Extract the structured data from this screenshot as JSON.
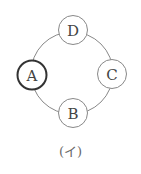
{
  "diagram": {
    "ring": {
      "cx": 72,
      "cy": 73,
      "r": 41,
      "stroke": "#888888",
      "stroke_width": 1
    },
    "nodes": [
      {
        "id": "D",
        "label": "D",
        "cx": 73,
        "cy": 30,
        "r": 14.5,
        "stroke": "#888888",
        "stroke_width": 1,
        "highlighted": false
      },
      {
        "id": "C",
        "label": "C",
        "cx": 112,
        "cy": 74,
        "r": 14.5,
        "stroke": "#888888",
        "stroke_width": 1,
        "highlighted": false
      },
      {
        "id": "B",
        "label": "B",
        "cx": 73,
        "cy": 113,
        "r": 14.5,
        "stroke": "#888888",
        "stroke_width": 1,
        "highlighted": false
      },
      {
        "id": "A",
        "label": "A",
        "cx": 32,
        "cy": 75,
        "r": 14.5,
        "stroke": "#333333",
        "stroke_width": 2,
        "highlighted": true
      }
    ],
    "caption": "(イ)"
  }
}
